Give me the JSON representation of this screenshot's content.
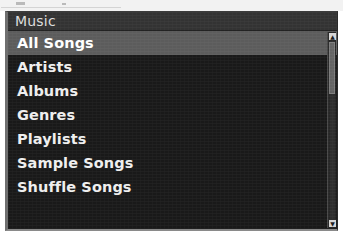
{
  "panel": {
    "header": {
      "title": "Music"
    },
    "items": [
      {
        "label": "All Songs",
        "selected": true
      },
      {
        "label": "Artists",
        "selected": false
      },
      {
        "label": "Albums",
        "selected": false
      },
      {
        "label": "Genres",
        "selected": false
      },
      {
        "label": "Playlists",
        "selected": false
      },
      {
        "label": "Sample Songs",
        "selected": false
      },
      {
        "label": "Shuffle Songs",
        "selected": false
      }
    ]
  },
  "scrollbar": {
    "up_arrow_glyph": "▲",
    "down_arrow_glyph": "▼"
  },
  "colors": {
    "panel_background": "#191919",
    "header_background": "#333333",
    "selected_row": "#5c5c5c",
    "text": "#efefef",
    "header_text": "#dcdcdc",
    "scrollbar_thumb": "#646464"
  }
}
